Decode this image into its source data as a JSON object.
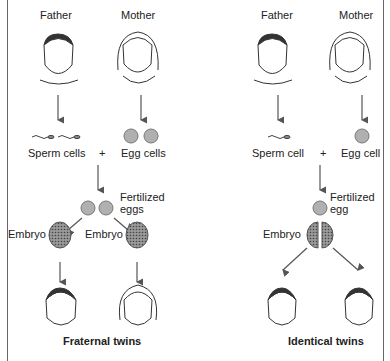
{
  "fraternal": {
    "father": "Father",
    "mother": "Mother",
    "sperm": "Sperm cells",
    "plus": "+",
    "egg": "Egg cells",
    "fertilized": "Fertilized",
    "fertilized2": "eggs",
    "embryo1": "Embryo",
    "embryo2": "Embryo",
    "caption": "Fraternal twins"
  },
  "identical": {
    "father": "Father",
    "mother": "Mother",
    "sperm": "Sperm cell",
    "plus": "+",
    "egg": "Egg cell",
    "fertilized": "Fertilized",
    "fertilized2": "egg",
    "embryo": "Embryo",
    "caption": "Identical twins"
  },
  "colors": {
    "egg": "#b0b0b0",
    "embryo": "#777777",
    "line": "#555555"
  }
}
